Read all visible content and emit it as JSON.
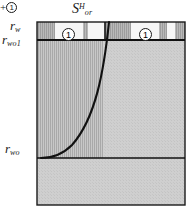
{
  "figure": {
    "title_label": {
      "base": "S",
      "subscript": "or",
      "superscript": "H"
    },
    "plus_marker": {
      "plus": "+",
      "number": "1"
    },
    "axis_labels": [
      {
        "name": "r_w",
        "base": "r",
        "subscript": "w",
        "y_px": 22
      },
      {
        "name": "r_wo1",
        "base": "r",
        "subscript": "wo1",
        "y_px": 40
      },
      {
        "name": "r_wo",
        "base": "r",
        "subscript": "wo",
        "y_px": 158
      }
    ],
    "band_markers": [
      {
        "name": "band-marker-left",
        "number": "1"
      },
      {
        "name": "band-marker-right",
        "number": "1"
      }
    ],
    "colors": {
      "body_fill": "#cfcfcf",
      "band_fill": "#b9b9b9",
      "hatch_line": "#9a9a9a",
      "gap_fill": "#f4f4f4",
      "stroke": "#1a1a1a",
      "background": "#ffffff"
    },
    "geometry": {
      "rect_left": 37,
      "rect_right": 185,
      "rect_top": 22,
      "rect_bottom": 205,
      "band_bottom": 40,
      "lower_line_y": 158,
      "tick_x": 105,
      "curve_start_x": 109,
      "curve_end_x": 41
    }
  }
}
